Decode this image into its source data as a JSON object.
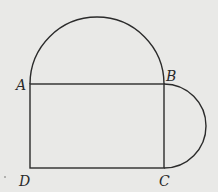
{
  "diagram": {
    "type": "geometry-figure",
    "colors": {
      "background": "#e9e9e7",
      "stroke": "#2b2b2b",
      "label": "#2a2a2a"
    },
    "points": {
      "A": {
        "label": "A",
        "x": 30,
        "y": 84
      },
      "B": {
        "label": "B",
        "x": 164,
        "y": 84
      },
      "C": {
        "label": "C",
        "x": 164,
        "y": 168
      },
      "D": {
        "label": "D",
        "x": 30,
        "y": 168
      }
    },
    "labels": {
      "A": "A",
      "B": "B",
      "C": "C",
      "D": "D"
    },
    "shapes": [
      {
        "kind": "rectangle",
        "vertices": [
          "A",
          "B",
          "C",
          "D"
        ]
      },
      {
        "kind": "semicircle",
        "diameter": [
          "A",
          "B"
        ],
        "side": "above"
      },
      {
        "kind": "semicircle",
        "diameter": [
          "B",
          "C"
        ],
        "side": "right"
      }
    ]
  }
}
